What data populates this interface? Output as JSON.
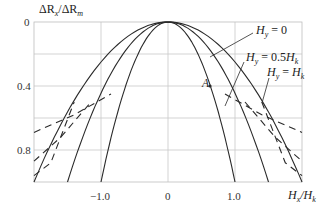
{
  "chart_data": {
    "type": "line",
    "title": "",
    "xlabel": "H_x/H_k",
    "ylabel": "ΔR_x/ΔR_m",
    "xlim": [
      -2.0,
      2.0
    ],
    "ylim": [
      0,
      1.0
    ],
    "y_inverted": true,
    "grid": true,
    "x_ticks": [
      {
        "value": -1.0,
        "label": "−1.0"
      },
      {
        "value": 0,
        "label": "0"
      },
      {
        "value": 1.0,
        "label": "1.0"
      }
    ],
    "y_ticks": [
      {
        "value": 0,
        "label": "0"
      },
      {
        "value": 0.4,
        "label": "0.4"
      },
      {
        "value": 0.8,
        "label": "0.8"
      }
    ],
    "x_gridlines": [
      -1.0,
      0,
      1.0
    ],
    "y_gridlines": [
      0.2,
      0.4,
      0.6,
      0.8
    ],
    "series": [
      {
        "name": "H_y = 0",
        "style": "solid",
        "x": [
          -1.0,
          -0.75,
          -0.5,
          -0.25,
          0,
          0.25,
          0.5,
          0.75,
          1.0
        ],
        "y": [
          1.0,
          0.56,
          0.25,
          0.06,
          0,
          0.06,
          0.25,
          0.56,
          1.0
        ]
      },
      {
        "name": "H_y = 0.5H_k",
        "style": "solid",
        "x": [
          -1.5,
          -1.125,
          -0.75,
          -0.375,
          0,
          0.375,
          0.75,
          1.125,
          1.5
        ],
        "y": [
          1.0,
          0.56,
          0.25,
          0.06,
          0,
          0.06,
          0.25,
          0.56,
          1.0
        ]
      },
      {
        "name": "H_y = H_k",
        "style": "solid",
        "x": [
          -2.0,
          -1.5,
          -1.0,
          -0.5,
          0,
          0.5,
          1.0,
          1.5,
          2.0
        ],
        "y": [
          1.0,
          0.56,
          0.25,
          0.06,
          0,
          0.06,
          0.25,
          0.56,
          1.0
        ]
      },
      {
        "name": "H_y = 0 (dashed branch)",
        "style": "dashed",
        "x": [
          -2.0,
          -1.4,
          -0.85,
          0.85,
          1.4,
          2.0
        ],
        "y": [
          0.69,
          0.58,
          0.45,
          0.45,
          0.58,
          0.69
        ]
      },
      {
        "name": "H_y = 0.5H_k (dashed branch)",
        "style": "dashed",
        "x": [
          -2.0,
          -1.6,
          -1.15,
          1.15,
          1.6,
          2.0
        ],
        "y": [
          0.87,
          0.72,
          0.5,
          0.5,
          0.72,
          0.87
        ]
      },
      {
        "name": "H_y = H_k (dashed branch)",
        "style": "dashed",
        "x": [
          -2.0,
          -1.75,
          -1.4,
          1.4,
          1.75,
          2.0
        ],
        "y": [
          0.96,
          0.88,
          0.5,
          0.5,
          0.88,
          0.96
        ]
      }
    ],
    "annotations": [
      {
        "text": "H_y = 0",
        "x": 1.45,
        "y": 0.17
      },
      {
        "text": "H_y = 0.5H_k",
        "x": 1.2,
        "y": 0.33
      },
      {
        "text": "H_y = H_k",
        "x": 1.5,
        "y": 0.45
      },
      {
        "text": "A",
        "x": 0.6,
        "y": 0.46
      }
    ]
  },
  "labels": {
    "ylabel_main": "ΔR",
    "ylabel_sub1": "x",
    "ylabel_mid": "/ΔR",
    "ylabel_sub2": "m",
    "xlabel_main": "H",
    "xlabel_sub1": "x",
    "xlabel_mid": "/H",
    "xlabel_sub2": "k",
    "y0": "0",
    "y04": "0.4",
    "y08": "0.8",
    "xm1": "−1.0",
    "x0": "0",
    "x1": "1.0",
    "hy0_a": "H",
    "hy0_b": "y",
    "hy0_c": " = 0",
    "hy05_a": "H",
    "hy05_b": "y",
    "hy05_c": " = 0.5",
    "hy05_d": "H",
    "hy05_e": "k",
    "hy1_a": "H",
    "hy1_b": "y",
    "hy1_c": " = ",
    "hy1_d": "H",
    "hy1_e": "k",
    "point_a": "A"
  }
}
